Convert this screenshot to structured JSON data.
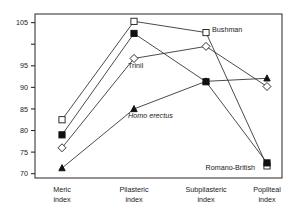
{
  "chart_data": {
    "type": "line",
    "title": "",
    "subtitle": "",
    "xlabel": "",
    "ylabel": "",
    "categories": [
      "Meric index",
      "Pilasteric index",
      "Subpilasteric index",
      "Popliteal index"
    ],
    "category_lines": [
      [
        "Meric",
        "index"
      ],
      [
        "Pilasteric",
        "index"
      ],
      [
        "Subpilasteric",
        "index"
      ],
      [
        "Popliteal",
        "index"
      ]
    ],
    "ylim": [
      69,
      107
    ],
    "yticks": [
      70,
      75,
      80,
      85,
      90,
      95,
      100,
      105
    ],
    "ytick_labels": [
      "70",
      "75",
      "80",
      "85",
      "90",
      "95",
      "",
      "105"
    ],
    "grid": false,
    "legend_position": "inline-annotations",
    "series": [
      {
        "name": "Bushman",
        "marker": "open-square",
        "values": [
          82.5,
          105.3,
          102.7,
          71.8
        ]
      },
      {
        "name": "Romano-British",
        "marker": "filled-square",
        "values": [
          79.0,
          102.5,
          91.3,
          72.5
        ]
      },
      {
        "name": "Trinil",
        "marker": "open-diamond",
        "values": [
          76.0,
          96.7,
          99.5,
          90.2
        ]
      },
      {
        "name": "Homo erectus",
        "marker": "filled-triangle",
        "values": [
          71.3,
          85.0,
          91.4,
          92.1
        ]
      }
    ],
    "annotations": [
      {
        "text": "Bushman",
        "italic": false,
        "target_series": "Bushman",
        "target_category": "Subpilasteric index"
      },
      {
        "text": "Trinil",
        "italic": false,
        "target_series": "Trinil",
        "target_category": "Pilasteric index"
      },
      {
        "text": "Homo erectus",
        "italic": true,
        "target_series": "Homo erectus",
        "target_category": "Pilasteric index"
      },
      {
        "text": "Romano-British",
        "italic": false,
        "target_series": "Romano-British",
        "target_category": "Popliteal index"
      }
    ]
  },
  "colors": {
    "background": "#ffffff",
    "frame": "#3a3a3a",
    "line": "#2b2b2b",
    "marker_fill": "#111111",
    "marker_open": "#ffffff",
    "text": "#1a1a1a"
  }
}
